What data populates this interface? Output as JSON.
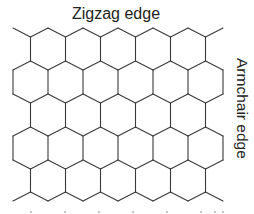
{
  "diagram": {
    "labels": {
      "top": "Zigzag edge",
      "side": "Armchair edge"
    },
    "colors": {
      "line": "#3a3a3a",
      "text": "#222222",
      "background": "#ffffff"
    },
    "lattice": {
      "x0": 13,
      "half_width": 17.5,
      "columns": 12,
      "y_levels": [
        28,
        37,
        61,
        70,
        94,
        103,
        127,
        136,
        160,
        169,
        192,
        201
      ],
      "full_rows": 2,
      "offset_rows": 1
    }
  }
}
